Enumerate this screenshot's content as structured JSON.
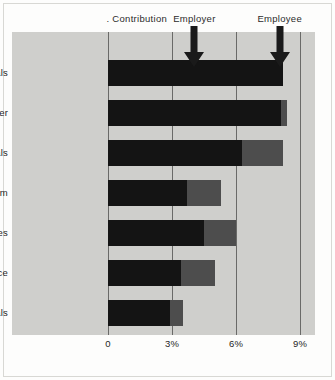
{
  "chart_data": {
    "type": "bar",
    "orientation": "horizontal",
    "stacked": true,
    "title": "",
    "subtitle": "",
    "xlabel": "",
    "ylabel": "",
    "xlim": [
      0,
      9.5
    ],
    "grid": true,
    "gridlines": [
      0,
      3,
      6,
      9
    ],
    "xticklabels": [
      "0",
      "3%",
      "6%",
      "9%"
    ],
    "categories": [
      "Primary metals",
      "Rubber",
      "Fabricated metals",
      "Petroleum",
      "Public utilities",
      "Insurance",
      "Hospitals"
    ],
    "series": [
      {
        "name": "Employer",
        "color": "#141414",
        "values": [
          8.2,
          8.1,
          6.3,
          3.7,
          4.5,
          3.4,
          2.9
        ]
      },
      {
        "name": "Employee",
        "color": "#4d4d4d",
        "values": [
          0.0,
          0.3,
          1.9,
          1.6,
          1.5,
          1.6,
          0.6
        ]
      }
    ],
    "totals": [
      8.2,
      8.4,
      8.2,
      5.3,
      6.0,
      5.0,
      3.5
    ],
    "annotations": [
      {
        "text": ". Contribution",
        "x_percent": 1.35,
        "arrow": false
      },
      {
        "text": "Employer",
        "x_percent": 4.05,
        "arrow": true
      },
      {
        "text": "Employee",
        "x_percent": 8.05,
        "arrow": true
      }
    ],
    "legend_position": "top-arrows",
    "plot_background": "#cfcfcc",
    "figure_background": "#fdfdfc",
    "gridline_color": "#6a6a68"
  }
}
